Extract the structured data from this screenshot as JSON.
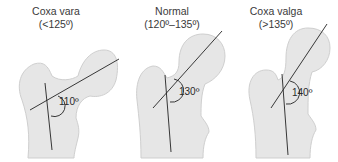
{
  "figure": {
    "panels": [
      {
        "title": "Coxa vara",
        "range": "(<125º)",
        "angle": "110º"
      },
      {
        "title": "Normal",
        "range": "(120º–135º)",
        "angle": "130º"
      },
      {
        "title": "Coxa valga",
        "range": ">135º",
        "range_display": "(>135º)",
        "angle": "140º"
      }
    ],
    "colors": {
      "bone_fill": "#e6e6e6",
      "bone_stroke": "#c8c8c8",
      "line": "#222222",
      "text": "#3a3a3a"
    }
  }
}
